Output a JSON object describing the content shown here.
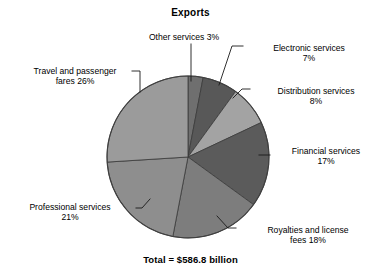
{
  "chart_data": {
    "type": "pie",
    "title": "Exports",
    "total_label": "Total = $586.8 billion",
    "total_value": 586.8,
    "total_units": "billion US dollars",
    "xlabel": "",
    "ylabel": "",
    "legend_position": "none",
    "grid": false,
    "labels_outside": true,
    "start_angle_deg": 0,
    "direction": "clockwise",
    "categories": [
      "Other services",
      "Electronic services",
      "Distribution services",
      "Financial services",
      "Royalties and license fees",
      "Professional services",
      "Travel and passenger fares"
    ],
    "values": [
      3,
      7,
      8,
      17,
      18,
      21,
      26
    ],
    "value_unit": "percent",
    "slices": [
      {
        "name": "Other services",
        "value": 3,
        "label": "Other services 3%",
        "color": "#6f6f6f",
        "start_deg": 0,
        "end_deg": 10.8
      },
      {
        "name": "Electronic services",
        "value": 7,
        "label": "Electronic services\n7%",
        "color": "#585858",
        "start_deg": 10.8,
        "end_deg": 36.0
      },
      {
        "name": "Distribution services",
        "value": 8,
        "label": "Distribution services\n8%",
        "color": "#a3a3a3",
        "start_deg": 36.0,
        "end_deg": 64.8
      },
      {
        "name": "Financial services",
        "value": 17,
        "label": "Financial services\n17%",
        "color": "#5b5b5b",
        "start_deg": 64.8,
        "end_deg": 126.0
      },
      {
        "name": "Royalties and license fees",
        "value": 18,
        "label": "Royalties and license\nfees 18%",
        "color": "#7d7d7d",
        "start_deg": 126.0,
        "end_deg": 190.8
      },
      {
        "name": "Professional services",
        "value": 21,
        "label": "Professional services\n21%",
        "color": "#8e8e8e",
        "start_deg": 190.8,
        "end_deg": 266.4
      },
      {
        "name": "Travel and passenger fares",
        "value": 26,
        "label": "Travel and passenger\nfares 26%",
        "color": "#9b9b9b",
        "start_deg": 266.4,
        "end_deg": 360.0
      }
    ],
    "colors": {
      "outline": "#3a3a3a",
      "leader_line": "#1a1a1a",
      "text": "#000000",
      "background": "#ffffff"
    }
  }
}
